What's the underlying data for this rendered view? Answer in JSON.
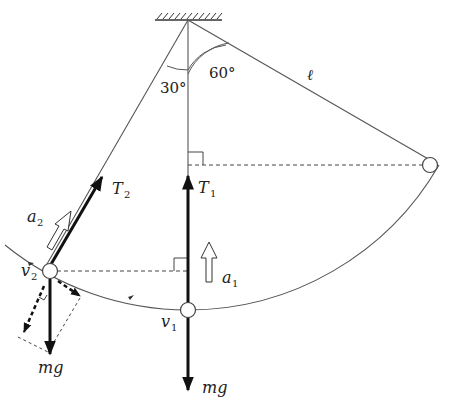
{
  "figure": {
    "labels": {
      "angle_left": "30°",
      "angle_right": "60°",
      "length": "ℓ",
      "tension_1": "T",
      "tension_1_sub": "1",
      "tension_2": "T",
      "tension_2_sub": "2",
      "accel_1": "a",
      "accel_1_sub": "1",
      "accel_2": "a",
      "accel_2_sub": "2",
      "velocity_1": "v",
      "velocity_1_sub": "1",
      "velocity_2": "v",
      "velocity_2_sub": "2",
      "weight_1": "mg",
      "weight_2": "mg"
    },
    "colors": {
      "line": "#555555",
      "force": "#111111",
      "background": "#ffffff"
    }
  }
}
